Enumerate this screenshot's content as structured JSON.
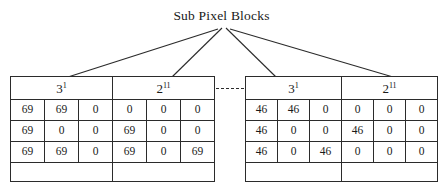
{
  "title": "Sub Pixel Blocks",
  "colors": {
    "line": "#2b2b2b",
    "text": "#1a1a1a",
    "background": "#ffffff"
  },
  "headers": [
    {
      "base": "3",
      "exponent": "1"
    },
    {
      "base": "2",
      "exponent": "11"
    },
    {
      "base": "3",
      "exponent": "1"
    },
    {
      "base": "2",
      "exponent": "11"
    }
  ],
  "separator": {
    "style": "dashed",
    "label": ""
  },
  "chart_data": {
    "type": "table",
    "title": "Sub Pixel Blocks",
    "blocks": [
      {
        "header_base": "3",
        "header_exponent": "1",
        "side": "left",
        "values": [
          [
            69,
            69,
            0
          ],
          [
            69,
            0,
            0
          ],
          [
            69,
            69,
            0
          ]
        ]
      },
      {
        "header_base": "2",
        "header_exponent": "11",
        "side": "left",
        "values": [
          [
            0,
            0,
            0
          ],
          [
            69,
            0,
            0
          ],
          [
            69,
            0,
            69
          ]
        ]
      },
      {
        "header_base": "3",
        "header_exponent": "1",
        "side": "right",
        "values": [
          [
            46,
            46,
            0
          ],
          [
            46,
            0,
            0
          ],
          [
            46,
            0,
            46
          ]
        ]
      },
      {
        "header_base": "2",
        "header_exponent": "11",
        "side": "right",
        "values": [
          [
            0,
            0,
            0
          ],
          [
            46,
            0,
            0
          ],
          [
            0,
            0,
            0
          ]
        ]
      }
    ]
  },
  "rows": [
    {
      "left": [
        "69",
        "69",
        "0",
        "0",
        "0",
        "0"
      ],
      "right": [
        "46",
        "46",
        "0",
        "0",
        "0",
        "0"
      ]
    },
    {
      "left": [
        "69",
        "0",
        "0",
        "69",
        "0",
        "0"
      ],
      "right": [
        "46",
        "0",
        "0",
        "46",
        "0",
        "0"
      ]
    },
    {
      "left": [
        "69",
        "69",
        "0",
        "69",
        "0",
        "69"
      ],
      "right": [
        "46",
        "0",
        "46",
        "0",
        "0",
        "0"
      ]
    }
  ],
  "empty_row": {
    "cells": [
      "",
      "",
      "",
      ""
    ]
  },
  "connectors": [
    {
      "name": "connector-to-block-1",
      "x1": 218,
      "y1": 29,
      "x2": 68,
      "y2": 77
    },
    {
      "name": "connector-to-block-2",
      "x1": 222,
      "y1": 28,
      "x2": 172,
      "y2": 77
    },
    {
      "name": "connector-to-block-3",
      "x1": 226,
      "y1": 28,
      "x2": 276,
      "y2": 77
    },
    {
      "name": "connector-to-block-4",
      "x1": 230,
      "y1": 29,
      "x2": 393,
      "y2": 77
    }
  ]
}
